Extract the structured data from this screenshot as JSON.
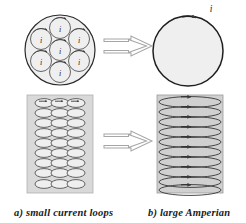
{
  "figure": {
    "title_alt": "Small current loops equivalent to large Amperian current loop",
    "colors": {
      "stroke": "#2b2b2b",
      "fill_light": "#efefef",
      "fill_panel": "#dcdcdc",
      "arrow_outline": "#9a9a9a",
      "text": "#1a1a1a"
    },
    "panels": {
      "top_left": {
        "name": "small-current-loops-cross-section",
        "outer_circle": {
          "cx": 60,
          "cy": 50,
          "r": 35
        },
        "loop_radius": 10.5,
        "loop_label": "i",
        "loops": [
          {
            "cx": 60,
            "cy": 50
          },
          {
            "cx": 60,
            "cy": 28
          },
          {
            "cx": 79,
            "cy": 39
          },
          {
            "cx": 79,
            "cy": 61
          },
          {
            "cx": 60,
            "cy": 72
          },
          {
            "cx": 41,
            "cy": 61
          },
          {
            "cx": 41,
            "cy": 39
          }
        ]
      },
      "top_right": {
        "name": "large-amperian-loop-cross-section",
        "outer_circle": {
          "cx": 188,
          "cy": 51,
          "r": 35
        },
        "current_label": "i",
        "label_x": 211,
        "label_y": 8
      },
      "bottom_left": {
        "name": "small-current-loops-side-view",
        "rect": {
          "x": 27,
          "y": 95,
          "w": 66,
          "h": 98
        },
        "columns": 3,
        "rows": 9,
        "ellipse_rx": 9,
        "ellipse_ry": 4.4
      },
      "bottom_right": {
        "name": "large-amperian-loop-side-view",
        "rect": {
          "x": 157,
          "y": 95,
          "w": 66,
          "h": 98
        },
        "rows": 10,
        "ellipse_rx": 31,
        "ellipse_ry": 5.4
      },
      "arrows": [
        {
          "name": "equivalence-arrow-top",
          "x": 104,
          "y": 36,
          "w": 48,
          "h": 20
        },
        {
          "name": "equivalence-arrow-bottom",
          "x": 104,
          "y": 131,
          "w": 48,
          "h": 20
        }
      ]
    },
    "captions": {
      "a": "a) small current loops",
      "b": "b) large Amperian"
    }
  }
}
